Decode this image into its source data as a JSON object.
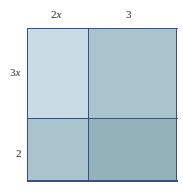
{
  "diagram": {
    "top_labels": [
      {
        "text": "2x",
        "coef": "2",
        "var": "x"
      },
      {
        "text": "3",
        "coef": "3",
        "var": ""
      }
    ],
    "left_labels": [
      {
        "text": "3x",
        "coef": "3",
        "var": "x"
      },
      {
        "text": "2",
        "coef": "2",
        "var": ""
      }
    ],
    "regions": [
      {
        "name": "top-left",
        "row": "3x",
        "col": "2x",
        "color": "#c9dce6"
      },
      {
        "name": "top-right",
        "row": "3x",
        "col": "3",
        "color": "#a9c4cc"
      },
      {
        "name": "bottom-left",
        "row": "2",
        "col": "2x",
        "color": "#a9c4cc"
      },
      {
        "name": "bottom-right",
        "row": "2",
        "col": "3",
        "color": "#93b2b9"
      }
    ],
    "line_color": "#3a4e8c"
  }
}
